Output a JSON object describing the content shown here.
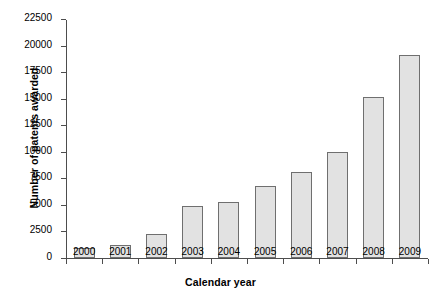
{
  "chart_data": {
    "type": "bar",
    "title": "",
    "xlabel": "Calendar year",
    "ylabel": "Number of patents awarded",
    "categories": [
      "2000",
      "2001",
      "2002",
      "2003",
      "2004",
      "2005",
      "2006",
      "2007",
      "2008",
      "2009"
    ],
    "values": [
      950,
      1250,
      2300,
      4850,
      5300,
      6800,
      8100,
      10000,
      15200,
      19100
    ],
    "ylim": [
      0,
      22500
    ],
    "yticks": [
      0,
      2500,
      5000,
      7500,
      10000,
      12500,
      15000,
      17500,
      20000,
      22500
    ],
    "ytick_labels": [
      "0",
      "2500",
      "5000",
      "7500",
      "10000",
      "12500",
      "15000",
      "17500",
      "20000",
      "22500"
    ],
    "grid": false,
    "legend": null,
    "bar_fill_color": "#e2e2e2",
    "bar_border_color": "#6f6f6f",
    "axis_color": "#4d4d4d",
    "background_color": "#ffffff"
  }
}
